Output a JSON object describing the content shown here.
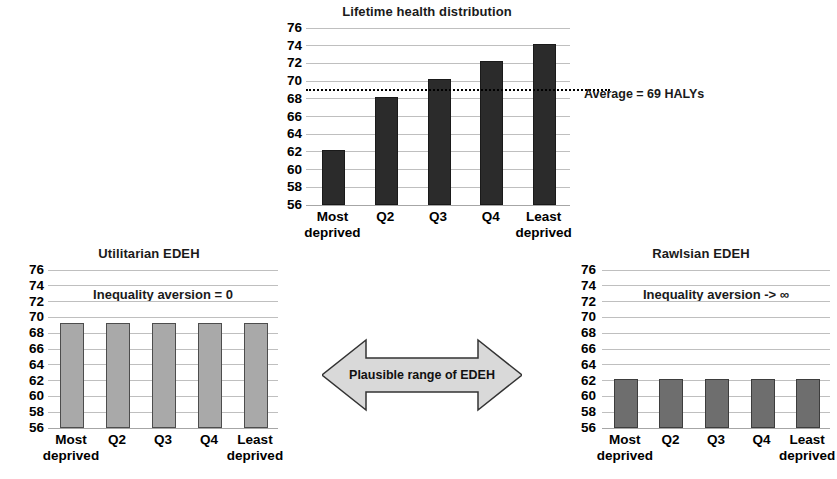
{
  "figure": {
    "background": "#ffffff",
    "axis_ticks": [
      76,
      74,
      72,
      70,
      68,
      66,
      64,
      62,
      60,
      58,
      56
    ]
  },
  "arrow": {
    "label": "Plausible range of EDEH",
    "fill": "#d9d9d9",
    "stroke": "#333333"
  },
  "chart_data": [
    {
      "id": "lifetime-health-distribution",
      "type": "bar",
      "title": "Lifetime health distribution",
      "categories": [
        "Most deprived",
        "Q2",
        "Q3",
        "Q4",
        "Least deprived"
      ],
      "values": [
        62,
        68,
        70,
        72,
        74
      ],
      "xlabel": "",
      "ylabel": "",
      "ylim": [
        56,
        76
      ],
      "ytick_step": 2,
      "grid": true,
      "bar_color": "#2b2b2b",
      "annotations": [
        {
          "name": "average-line",
          "kind": "hline",
          "value": 69,
          "style": "dotted",
          "color": "#000000"
        },
        {
          "name": "average-caption",
          "kind": "text",
          "text": "Average = 69 HALYs"
        }
      ]
    },
    {
      "id": "utilitarian-edeh",
      "type": "bar",
      "title": "Utilitarian EDEH",
      "categories": [
        "Most deprived",
        "Q2",
        "Q3",
        "Q4",
        "Least deprived"
      ],
      "values": [
        69,
        69,
        69,
        69,
        69
      ],
      "xlabel": "",
      "ylabel": "",
      "ylim": [
        56,
        76
      ],
      "ytick_step": 2,
      "grid": true,
      "bar_color": "#a9a9a9",
      "annotations": [
        {
          "name": "inequality-aversion-note",
          "kind": "text",
          "text": "Inequality aversion = 0"
        }
      ]
    },
    {
      "id": "rawlsian-edeh",
      "type": "bar",
      "title": "Rawlsian EDEH",
      "categories": [
        "Most deprived",
        "Q2",
        "Q3",
        "Q4",
        "Least deprived"
      ],
      "values": [
        62,
        62,
        62,
        62,
        62
      ],
      "xlabel": "",
      "ylabel": "",
      "ylim": [
        56,
        76
      ],
      "ytick_step": 2,
      "grid": true,
      "bar_color": "#6e6e6e",
      "annotations": [
        {
          "name": "inequality-aversion-note",
          "kind": "text",
          "text": "Inequality aversion -> ∞"
        }
      ]
    }
  ]
}
